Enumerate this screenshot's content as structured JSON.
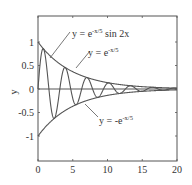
{
  "chart_data": {
    "type": "line",
    "title": "",
    "xlabel": "",
    "ylabel": "y",
    "xlim": [
      0,
      20
    ],
    "ylim": [
      -1.5,
      1.55
    ],
    "grid": false,
    "x_ticks": [
      0,
      5,
      10,
      15,
      20
    ],
    "x_tick_labels": [
      "0",
      "5",
      "10",
      "15",
      "20"
    ],
    "y_ticks": [
      1,
      0.5,
      0,
      -0.5,
      -1
    ],
    "y_tick_labels": [
      "1",
      "0.5",
      "0",
      "-0.5",
      "-1"
    ],
    "series": [
      {
        "name": "y = e^(-x/5) sin 2x",
        "function": "exp(-x/5)*sin(2x)",
        "color": "#555555"
      },
      {
        "name": "y = e^(-x/5)",
        "function": "exp(-x/5)",
        "color": "#555555"
      },
      {
        "name": "y = -e^(-x/5)",
        "function": "-exp(-x/5)",
        "color": "#555555"
      },
      {
        "name": "y = 0",
        "function": "0",
        "color": "#555555"
      }
    ],
    "annotations": [
      {
        "base": "y = e",
        "sup": "-x/5",
        "tail": " sin 2x",
        "x_px": 72,
        "y_px": 37,
        "pointer": [
          [
            70,
            32
          ],
          [
            50,
            58
          ]
        ]
      },
      {
        "base": "y = e",
        "sup": "-x/5",
        "tail": "",
        "x_px": 88,
        "y_px": 56,
        "pointer": [
          [
            90,
            51
          ],
          [
            76,
            68
          ]
        ]
      },
      {
        "base": "y = -e",
        "sup": "-x/5",
        "tail": "",
        "x_px": 99,
        "y_px": 124,
        "pointer": [
          [
            98,
            117
          ],
          [
            85,
            104
          ]
        ]
      }
    ],
    "legend": "none (inline annotations)"
  },
  "colors": {
    "axis": "#555555",
    "curve": "#555555",
    "text": "#333333"
  }
}
